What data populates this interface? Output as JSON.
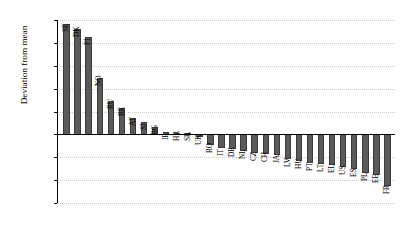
{
  "chart_data": {
    "type": "bar",
    "title": "",
    "xlabel": "",
    "ylabel": "Deviation from mean",
    "ylim": [
      -1.5,
      2.5
    ],
    "ytick_step": 0.5,
    "grid": true,
    "legend": "none",
    "orientation": "vertical",
    "bar_color": "#5a5a5a",
    "categories": [
      "SE",
      "DK",
      "FI",
      "NO",
      "RU",
      "BE",
      "AT",
      "SI",
      "BG",
      "IE",
      "HR",
      "SK",
      "UK",
      "RO",
      "IT",
      "DE",
      "NL",
      "CZ",
      "CH",
      "JA",
      "LV",
      "HU",
      "PT",
      "LT",
      "EL",
      "US",
      "ES",
      "PL",
      "EE",
      "FR"
    ],
    "values": [
      2.42,
      2.3,
      2.13,
      1.23,
      0.74,
      0.57,
      0.35,
      0.27,
      0.16,
      0.05,
      0.03,
      0.02,
      -0.05,
      -0.23,
      -0.3,
      -0.32,
      -0.36,
      -0.41,
      -0.42,
      -0.44,
      -0.53,
      -0.58,
      -0.62,
      -0.64,
      -0.66,
      -0.72,
      -0.76,
      -0.84,
      -0.88,
      -1.13
    ],
    "ytick_labels": [
      "2.50",
      "2.00",
      "1.50",
      "1.00",
      "0.50",
      "0.00",
      "-0.50",
      "-1.00",
      "-1.50"
    ],
    "ytick_values": [
      2.5,
      2.0,
      1.5,
      1.0,
      0.5,
      0.0,
      -0.5,
      -1.0,
      -1.5
    ]
  }
}
